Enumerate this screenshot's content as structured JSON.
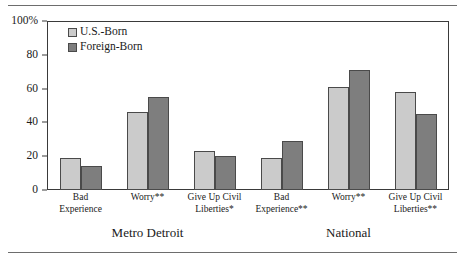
{
  "chart_data": {
    "type": "bar",
    "title": "",
    "subtitle": "",
    "xlabel": "",
    "ylabel": "",
    "ylim": [
      0,
      100
    ],
    "ytick_labels": [
      "0",
      "20",
      "40",
      "60",
      "80",
      "100%"
    ],
    "ytick_values": [
      0,
      20,
      40,
      60,
      80,
      100
    ],
    "grid": false,
    "legend_position": "top-left",
    "categories": [
      "Bad Experience",
      "Worry**",
      "Give Up Civil Liberties*",
      "Bad Experience**",
      "Worry**",
      "Give Up Civil Liberties**"
    ],
    "category_lines": [
      [
        "Bad",
        "Experience"
      ],
      [
        "Worry**"
      ],
      [
        "Give Up Civil",
        "Liberties*"
      ],
      [
        "Bad",
        "Experience**"
      ],
      [
        "Worry**"
      ],
      [
        "Give Up Civil",
        "Liberties**"
      ]
    ],
    "groups": [
      {
        "label": "Metro Detroit",
        "categories": [
          0,
          1,
          2
        ]
      },
      {
        "label": "National",
        "categories": [
          3,
          4,
          5
        ]
      }
    ],
    "series": [
      {
        "name": "U.S.-Born",
        "color": "#cbcbcb",
        "values": [
          19,
          46,
          23,
          19,
          61,
          58
        ]
      },
      {
        "name": "Foreign-Born",
        "color": "#7e7e7e",
        "values": [
          14,
          55,
          20,
          29,
          71,
          45
        ]
      }
    ]
  },
  "legend": {
    "items": [
      {
        "label": "U.S.-Born"
      },
      {
        "label": "Foreign-Born"
      }
    ]
  },
  "axis": {
    "y_labels": [
      "100%",
      "80",
      "60",
      "40",
      "20",
      "0"
    ]
  },
  "colors": {
    "us_born": "#cbcbcb",
    "foreign_born": "#7e7e7e",
    "frame": "#3a3a3a",
    "rule": "#6d6d6d"
  }
}
